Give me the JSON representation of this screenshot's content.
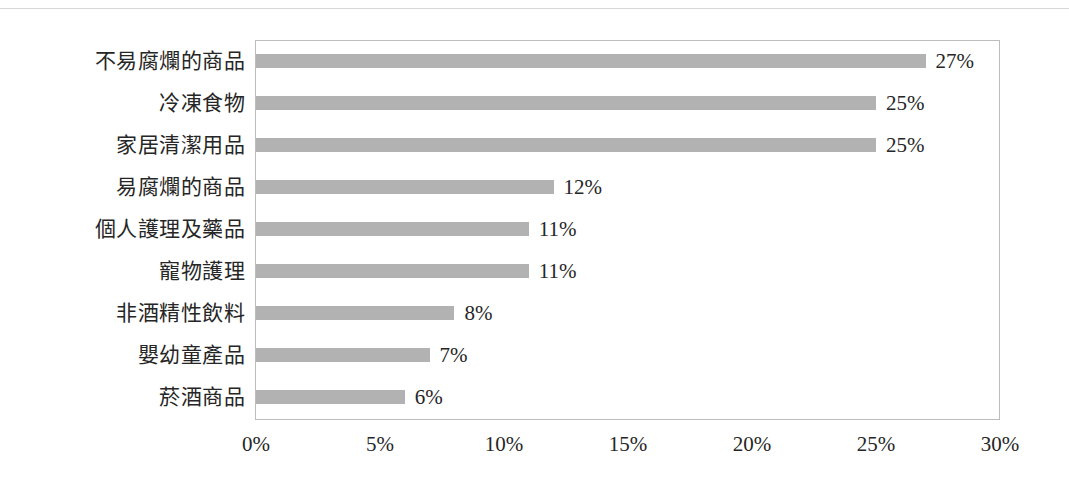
{
  "chart_data": {
    "type": "bar",
    "orientation": "horizontal",
    "title": "",
    "subtitle": "",
    "xlabel": "",
    "ylabel": "",
    "categories": [
      "不易腐爛的商品",
      "冷凍食物",
      "家居清潔用品",
      "易腐爛的商品",
      "個人護理及藥品",
      "寵物護理",
      "非酒精性飲料",
      "嬰幼童產品",
      "菸酒商品"
    ],
    "values": [
      27,
      25,
      25,
      12,
      11,
      11,
      8,
      7,
      6
    ],
    "value_labels": [
      "27%",
      "25%",
      "25%",
      "12%",
      "11%",
      "11%",
      "8%",
      "7%",
      "6%"
    ],
    "xlim": [
      0,
      30
    ],
    "xticks": [
      0,
      5,
      10,
      15,
      20,
      25,
      30
    ],
    "xtick_labels": [
      "0%",
      "5%",
      "10%",
      "15%",
      "20%",
      "25%",
      "30%"
    ],
    "grid": false,
    "legend": null,
    "bar_color": "#b2b2b2",
    "plot_border_color": "#bdbdbd",
    "text_color": "#262626"
  }
}
